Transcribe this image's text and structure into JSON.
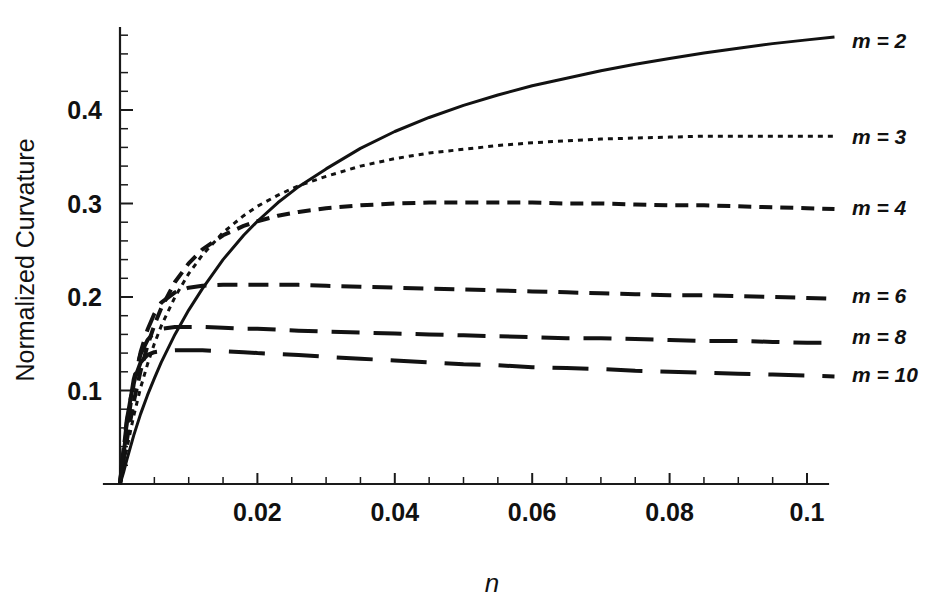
{
  "chart_data": {
    "type": "line",
    "title": "",
    "xlabel": "n",
    "ylabel": "Normalized Curvature",
    "xlim": [
      0,
      0.1055
    ],
    "ylim": [
      0,
      0.52
    ],
    "grid": false,
    "legend_position": "right-outside",
    "x_ticks_major": [
      0.02,
      0.04,
      0.06,
      0.08,
      0.1
    ],
    "x_tick_labels": [
      "0.02",
      "0.04",
      "0.06",
      "0.08",
      "0.1"
    ],
    "x_ticks_minor_step": 0.005,
    "y_ticks_major": [
      0.1,
      0.2,
      0.3,
      0.4
    ],
    "y_tick_labels": [
      "0.1",
      "0.2",
      "0.3",
      "0.4"
    ],
    "y_ticks_minor_step": 0.02,
    "series": [
      {
        "name": "m = 2",
        "m": 2,
        "style": "solid",
        "dasharray": "",
        "label_y": 0.475,
        "x": [
          0,
          0.0005,
          0.001,
          0.002,
          0.003,
          0.004,
          0.005,
          0.006,
          0.008,
          0.01,
          0.012,
          0.015,
          0.018,
          0.02,
          0.023,
          0.026,
          0.03,
          0.035,
          0.04,
          0.045,
          0.05,
          0.055,
          0.06,
          0.065,
          0.07,
          0.075,
          0.08,
          0.085,
          0.09,
          0.095,
          0.1,
          0.104
        ],
        "values": [
          0,
          0.012,
          0.026,
          0.052,
          0.075,
          0.095,
          0.113,
          0.13,
          0.16,
          0.186,
          0.209,
          0.24,
          0.266,
          0.281,
          0.301,
          0.318,
          0.337,
          0.359,
          0.377,
          0.392,
          0.405,
          0.416,
          0.426,
          0.434,
          0.442,
          0.449,
          0.455,
          0.461,
          0.466,
          0.471,
          0.475,
          0.478
        ]
      },
      {
        "name": "m = 3",
        "m": 3,
        "style": "dotted",
        "dasharray": "5 5",
        "label_y": 0.372,
        "x": [
          0,
          0.0005,
          0.001,
          0.002,
          0.003,
          0.004,
          0.005,
          0.006,
          0.008,
          0.01,
          0.012,
          0.015,
          0.018,
          0.02,
          0.023,
          0.026,
          0.03,
          0.035,
          0.04,
          0.045,
          0.05,
          0.055,
          0.06,
          0.065,
          0.07,
          0.075,
          0.08,
          0.085,
          0.09,
          0.095,
          0.1,
          0.104
        ],
        "values": [
          0,
          0.019,
          0.038,
          0.073,
          0.103,
          0.128,
          0.15,
          0.169,
          0.2,
          0.225,
          0.245,
          0.269,
          0.287,
          0.297,
          0.309,
          0.319,
          0.329,
          0.34,
          0.348,
          0.354,
          0.358,
          0.362,
          0.365,
          0.367,
          0.369,
          0.37,
          0.371,
          0.372,
          0.372,
          0.372,
          0.372,
          0.372
        ]
      },
      {
        "name": "m = 4",
        "m": 4,
        "style": "dashed-short",
        "dasharray": "13 8",
        "label_y": 0.296,
        "x": [
          0,
          0.0005,
          0.001,
          0.002,
          0.003,
          0.004,
          0.005,
          0.006,
          0.008,
          0.01,
          0.012,
          0.015,
          0.018,
          0.02,
          0.023,
          0.026,
          0.03,
          0.035,
          0.04,
          0.045,
          0.05,
          0.055,
          0.06,
          0.065,
          0.07,
          0.075,
          0.08,
          0.085,
          0.09,
          0.095,
          0.1,
          0.104
        ],
        "values": [
          0,
          0.024,
          0.047,
          0.088,
          0.121,
          0.148,
          0.17,
          0.188,
          0.216,
          0.236,
          0.251,
          0.266,
          0.276,
          0.281,
          0.287,
          0.291,
          0.295,
          0.298,
          0.3,
          0.301,
          0.301,
          0.301,
          0.301,
          0.3,
          0.3,
          0.299,
          0.298,
          0.298,
          0.297,
          0.296,
          0.295,
          0.294
        ]
      },
      {
        "name": "m = 6",
        "m": 6,
        "style": "dashed-medium",
        "dasharray": "20 11",
        "label_y": 0.202,
        "x": [
          0,
          0.0005,
          0.001,
          0.002,
          0.003,
          0.004,
          0.005,
          0.006,
          0.008,
          0.01,
          0.012,
          0.015,
          0.018,
          0.02,
          0.023,
          0.026,
          0.03,
          0.035,
          0.04,
          0.045,
          0.05,
          0.055,
          0.06,
          0.065,
          0.07,
          0.075,
          0.08,
          0.085,
          0.09,
          0.095,
          0.1,
          0.104
        ],
        "values": [
          0,
          0.031,
          0.06,
          0.107,
          0.141,
          0.165,
          0.182,
          0.194,
          0.205,
          0.21,
          0.212,
          0.213,
          0.213,
          0.213,
          0.213,
          0.213,
          0.212,
          0.211,
          0.21,
          0.209,
          0.208,
          0.207,
          0.206,
          0.205,
          0.204,
          0.203,
          0.202,
          0.202,
          0.201,
          0.2,
          0.199,
          0.198
        ]
      },
      {
        "name": "m = 8",
        "m": 8,
        "style": "dashed-long",
        "dasharray": "28 14",
        "label_y": 0.158,
        "x": [
          0,
          0.0005,
          0.001,
          0.002,
          0.003,
          0.004,
          0.005,
          0.006,
          0.008,
          0.01,
          0.012,
          0.015,
          0.018,
          0.02,
          0.023,
          0.026,
          0.03,
          0.035,
          0.04,
          0.045,
          0.05,
          0.055,
          0.06,
          0.065,
          0.07,
          0.075,
          0.08,
          0.085,
          0.09,
          0.095,
          0.1,
          0.104
        ],
        "values": [
          0,
          0.035,
          0.066,
          0.112,
          0.139,
          0.154,
          0.162,
          0.166,
          0.168,
          0.168,
          0.168,
          0.167,
          0.166,
          0.166,
          0.165,
          0.164,
          0.163,
          0.162,
          0.161,
          0.16,
          0.159,
          0.158,
          0.157,
          0.156,
          0.156,
          0.155,
          0.154,
          0.153,
          0.153,
          0.152,
          0.151,
          0.151
        ]
      },
      {
        "name": "m = 10",
        "m": 10,
        "style": "dashed-extralong",
        "dasharray": "36 18",
        "label_y": 0.118,
        "x": [
          0,
          0.0005,
          0.001,
          0.002,
          0.003,
          0.004,
          0.005,
          0.006,
          0.008,
          0.01,
          0.012,
          0.015,
          0.018,
          0.02,
          0.023,
          0.026,
          0.03,
          0.035,
          0.04,
          0.045,
          0.05,
          0.055,
          0.06,
          0.065,
          0.07,
          0.075,
          0.08,
          0.085,
          0.09,
          0.095,
          0.1,
          0.104
        ],
        "values": [
          0,
          0.037,
          0.069,
          0.11,
          0.13,
          0.138,
          0.141,
          0.142,
          0.143,
          0.143,
          0.143,
          0.142,
          0.141,
          0.14,
          0.139,
          0.138,
          0.136,
          0.134,
          0.132,
          0.13,
          0.128,
          0.127,
          0.125,
          0.124,
          0.123,
          0.121,
          0.12,
          0.119,
          0.118,
          0.117,
          0.116,
          0.115
        ]
      }
    ]
  },
  "labels": {
    "y_axis_title": "Normalized Curvature",
    "x_axis_title": "n"
  },
  "colors": {
    "ink": "#121212",
    "background": "#ffffff"
  }
}
